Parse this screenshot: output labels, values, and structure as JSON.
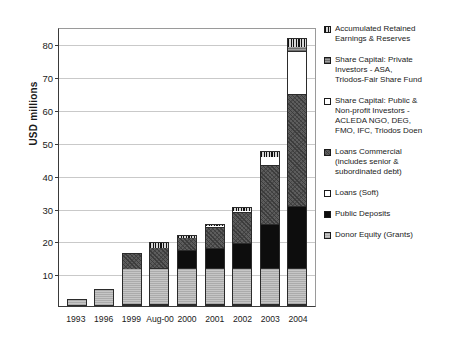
{
  "chart_data": {
    "type": "bar",
    "subtype": "stacked-vertical",
    "title": "",
    "xlabel": "",
    "ylabel": "USD millions",
    "ylim": [
      0,
      85
    ],
    "yticks": [
      10,
      20,
      30,
      40,
      50,
      60,
      70,
      80
    ],
    "grid": true,
    "legend_position": "right",
    "categories": [
      "1993",
      "1996",
      "1999",
      "Aug-00",
      "2000",
      "2001",
      "2002",
      "2003",
      "2004"
    ],
    "series": [
      {
        "name": "Donor Equity (Grants)",
        "fill": "light-grey",
        "values": [
          1.5,
          4.6,
          11.0,
          11.0,
          11.0,
          11.0,
          11.0,
          11.0,
          11.0
        ]
      },
      {
        "name": "Public Deposits",
        "fill": "black",
        "values": [
          0,
          0,
          0,
          0,
          5.5,
          6.0,
          7.5,
          13.5,
          19.0
        ]
      },
      {
        "name": "Loans (Soft)",
        "fill": "white",
        "values": [
          0,
          0,
          0,
          0,
          0,
          0,
          0,
          0,
          0
        ]
      },
      {
        "name": "Loans Commercial (includes senior & subordinated debt)",
        "fill": "speckle-dark",
        "values": [
          0,
          0,
          4.5,
          6.5,
          4.0,
          6.5,
          9.5,
          18.0,
          34.0
        ]
      },
      {
        "name": "Share Capital: Public & Non-profit Investors - ACLEDA NGO, DEG, FMO, IFC, Triodos Doen",
        "fill": "white",
        "values": [
          0,
          0,
          0,
          0,
          0,
          0.5,
          0.5,
          2.5,
          13.0
        ]
      },
      {
        "name": "Share Capital: Private Investors - ASA, Triodos-Fair Share Fund",
        "fill": "mid-grey",
        "values": [
          0,
          0,
          0,
          0,
          0,
          0,
          0,
          0,
          1.5
        ]
      },
      {
        "name": "Accumulated Retained Earnings & Reserves",
        "fill": "vertical-hatch",
        "values": [
          0,
          0,
          0,
          1.5,
          0.5,
          0.5,
          1.0,
          1.5,
          2.5
        ]
      }
    ],
    "totals": [
      1.5,
      4.6,
      15.5,
      19.0,
      21.0,
      24.5,
      29.5,
      46.5,
      81.0
    ]
  },
  "axis": {
    "y_title": "USD millions",
    "y_tick_labels": [
      "80",
      "70",
      "60",
      "50",
      "40",
      "30",
      "20",
      "10"
    ],
    "x_tick_labels": [
      "1993",
      "1996",
      "1999",
      "Aug-00",
      "2000",
      "2001",
      "2002",
      "2003",
      "2004"
    ]
  },
  "legend": {
    "items": [
      {
        "label": "Accumulated Retained\nEarnings & Reserves",
        "fill": "vertical-hatch"
      },
      {
        "label": "Share Capital: Private\nInvestors - ASA,\nTriodos-Fair Share Fund",
        "fill": "mid-grey"
      },
      {
        "label": "Share Capital: Public &\nNon-profit Investors -\nACLEDA NGO, DEG,\nFMO, IFC, Triodos Doen",
        "fill": "white"
      },
      {
        "label": "Loans Commercial\n(includes senior &\nsubordinated debt)",
        "fill": "speckle-dark"
      },
      {
        "label": "Loans (Soft)",
        "fill": "white"
      },
      {
        "label": "Public Deposits",
        "fill": "black"
      },
      {
        "label": "Donor Equity (Grants)",
        "fill": "light-grey"
      }
    ]
  },
  "colors": {
    "axis": "#3a3a3a",
    "grid": "#c9c9c9",
    "black": "#0d0d0d",
    "mid_grey": "#8a8a8a",
    "light_grey": "#b9b9b9",
    "speckle_dark": "#5d5d5d",
    "white": "#ffffff"
  }
}
